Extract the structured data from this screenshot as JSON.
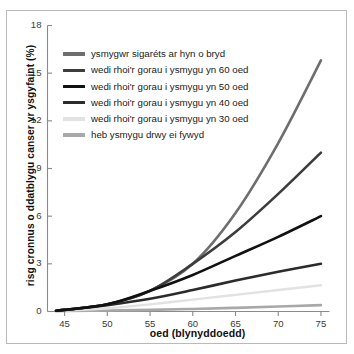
{
  "chart_data": {
    "type": "line",
    "title": "",
    "xlabel": "oed (blynyddoedd)",
    "ylabel": "risg cronnus o ddatblygu canser yr ysgyfaint (%)",
    "xlim": [
      43,
      76
    ],
    "ylim": [
      0,
      18
    ],
    "xticks": [
      45,
      50,
      55,
      60,
      65,
      70,
      75
    ],
    "yticks": [
      0,
      3,
      6,
      9,
      12,
      15,
      18
    ],
    "grid": false,
    "legend_position": "upper left",
    "x": [
      44,
      45,
      50,
      55,
      60,
      65,
      70,
      75
    ],
    "series": [
      {
        "name": "ysmygwr sigaréts ar hyn o bryd",
        "color": "#6e6e6e",
        "width": 2.6,
        "values": [
          0.05,
          0.1,
          0.45,
          1.3,
          3.0,
          6.2,
          10.6,
          15.8
        ]
      },
      {
        "name": "wedi rhoi'r gorau i ysmygu yn 60 oed",
        "color": "#3c3c3c",
        "width": 2.6,
        "values": [
          0.05,
          0.1,
          0.45,
          1.3,
          3.0,
          5.0,
          7.4,
          10.0
        ]
      },
      {
        "name": "wedi rhoi'r gorau i ysmygu yn 50 oed",
        "color": "#111111",
        "width": 2.6,
        "values": [
          0.05,
          0.1,
          0.45,
          1.3,
          2.3,
          3.5,
          4.7,
          6.0
        ]
      },
      {
        "name": "wedi rhoi'r gorau i ysmygu yn 40 oed",
        "color": "#2b2b2b",
        "width": 2.6,
        "values": [
          0.05,
          0.1,
          0.4,
          0.8,
          1.35,
          1.95,
          2.5,
          3.0
        ]
      },
      {
        "name": "wedi rhoi'r gorau i ysmygu yn 30 oed",
        "color": "#e2e2e2",
        "width": 2.4,
        "values": [
          0.03,
          0.05,
          0.2,
          0.45,
          0.75,
          1.05,
          1.35,
          1.65
        ]
      },
      {
        "name": "heb ysmygu drwy ei fywyd",
        "color": "#a8a8a8",
        "width": 2.6,
        "values": [
          0.02,
          0.03,
          0.06,
          0.1,
          0.16,
          0.23,
          0.31,
          0.4
        ]
      }
    ]
  },
  "legend": {
    "items": [
      "ysmygwr sigaréts ar hyn o bryd",
      "wedi rhoi'r gorau i ysmygu yn 60 oed",
      "wedi rhoi'r gorau i ysmygu yn 50 oed",
      "wedi rhoi'r gorau i ysmygu yn 40 oed",
      "wedi rhoi'r gorau i ysmygu yn 30 oed",
      "heb ysmygu drwy ei fywyd"
    ]
  },
  "colors": {
    "axis": "#8a8a8a",
    "frame": "#b9b9b9",
    "tick_text": "#3a3a3a",
    "label_text": "#111111",
    "background": "#ffffff"
  }
}
